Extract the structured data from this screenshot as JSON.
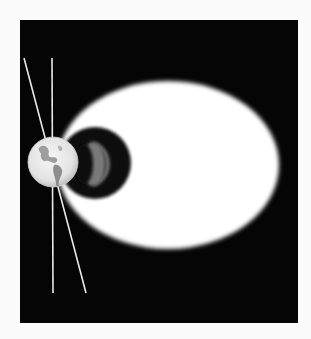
{
  "figure": {
    "colors": {
      "page_background": "#fbfbfb",
      "panel_background": "#050505",
      "glow": "#ffffff",
      "dark_core": "#0a0a0a",
      "crescent": "#8a8a8a",
      "earth": "#ececec",
      "earth_land": "#7d7d7d",
      "axis_lines": "#e8e8e8"
    },
    "elements": [
      {
        "name": "glow-ellipse",
        "cx": 168,
        "cy": 165,
        "rx": 111,
        "ry": 84
      },
      {
        "name": "dark-disk",
        "cx": 95,
        "cy": 163,
        "r": 36
      },
      {
        "name": "gray-crescent",
        "cx": 92,
        "cy": 164,
        "r": 24
      },
      {
        "name": "earth-globe",
        "cx": 53,
        "cy": 162,
        "r": 25
      },
      {
        "name": "vertical-axis-line",
        "x1": 52,
        "y1": 58,
        "x2": 53,
        "y2": 293
      },
      {
        "name": "tilted-axis-line",
        "x1": 24,
        "y1": 58,
        "x2": 86,
        "y2": 293
      }
    ]
  }
}
